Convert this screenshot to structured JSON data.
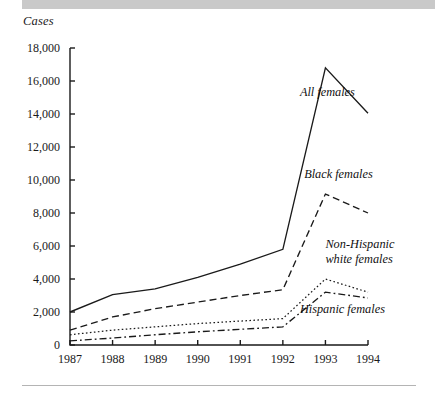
{
  "figure": {
    "y_axis_title": "Cases",
    "top_band_color": "#c9c9c9",
    "background_color": "#ffffff",
    "line_color": "#1a1a1a"
  },
  "chart_data": {
    "type": "line",
    "title": "",
    "xlabel": "",
    "ylabel": "Cases",
    "x": [
      1987,
      1988,
      1989,
      1990,
      1991,
      1992,
      1993,
      1994
    ],
    "categories": [
      "1987",
      "1988",
      "1989",
      "1990",
      "1991",
      "1992",
      "1993",
      "1994"
    ],
    "xtick_labels": [
      "1987",
      "1988",
      "1989",
      "1990",
      "1991",
      "1992",
      "1993",
      "1994"
    ],
    "ytick_labels": [
      "0",
      "2,000",
      "4,000",
      "6,000",
      "8,000",
      "10,000",
      "12,000",
      "14,000",
      "16,000",
      "18,000"
    ],
    "ytick_values": [
      0,
      2000,
      4000,
      6000,
      8000,
      10000,
      12000,
      14000,
      16000,
      18000
    ],
    "ylim": [
      0,
      18000
    ],
    "xlim": [
      1987,
      1994
    ],
    "grid": false,
    "legend": "inline-annotations",
    "series": [
      {
        "name": "All females",
        "style": "solid",
        "values": [
          2000,
          3050,
          3400,
          4100,
          4900,
          5800,
          16800,
          14050
        ],
        "label_x": 1992.4,
        "label_y": 15300
      },
      {
        "name": "Black females",
        "style": "dashed",
        "values": [
          900,
          1700,
          2200,
          2600,
          3000,
          3350,
          9150,
          8000
        ],
        "label_x": 1992.5,
        "label_y": 10300
      },
      {
        "name": "Non-Hispanic white females",
        "style": "dotted",
        "values": [
          620,
          900,
          1100,
          1300,
          1450,
          1600,
          4000,
          3200
        ],
        "label_x": 1993.0,
        "label_y": 6050
      },
      {
        "name": "Hispanic females",
        "style": "dashdot",
        "values": [
          250,
          420,
          620,
          800,
          950,
          1100,
          3200,
          2850
        ],
        "label_x": 1992.4,
        "label_y": 2150
      }
    ]
  }
}
